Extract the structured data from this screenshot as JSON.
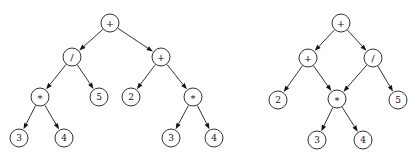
{
  "figure": {
    "background_color": "#ffffff",
    "stroke_color": "#1b1b1b",
    "node_fill_color": "#ffffff",
    "text_color": "#111111",
    "node_radius": 9,
    "arrow_style": "filled-triangle"
  },
  "graphs": [
    {
      "id": "left-tree",
      "name": "expression-tree",
      "kind": "tree",
      "nodes": [
        {
          "id": "L0",
          "label": "+",
          "kind": "operator",
          "x": 110,
          "y": 23
        },
        {
          "id": "L1",
          "label": "/",
          "kind": "operator",
          "x": 72,
          "y": 57
        },
        {
          "id": "L2",
          "label": "+",
          "kind": "operator",
          "x": 161,
          "y": 57
        },
        {
          "id": "L3",
          "label": "*",
          "kind": "operator",
          "x": 40,
          "y": 97
        },
        {
          "id": "L4",
          "label": "5",
          "kind": "leaf",
          "x": 99,
          "y": 97
        },
        {
          "id": "L5",
          "label": "2",
          "kind": "leaf",
          "x": 131,
          "y": 97
        },
        {
          "id": "L6",
          "label": "*",
          "kind": "operator",
          "x": 193,
          "y": 97
        },
        {
          "id": "L7",
          "label": "3",
          "kind": "leaf",
          "x": 19,
          "y": 138
        },
        {
          "id": "L8",
          "label": "4",
          "kind": "leaf",
          "x": 64,
          "y": 138
        },
        {
          "id": "L9",
          "label": "3",
          "kind": "leaf",
          "x": 171,
          "y": 138
        },
        {
          "id": "L10",
          "label": "4",
          "kind": "leaf",
          "x": 214,
          "y": 138
        }
      ],
      "edges": [
        {
          "from": "L0",
          "to": "L1"
        },
        {
          "from": "L0",
          "to": "L2"
        },
        {
          "from": "L1",
          "to": "L3"
        },
        {
          "from": "L1",
          "to": "L4"
        },
        {
          "from": "L2",
          "to": "L5"
        },
        {
          "from": "L2",
          "to": "L6"
        },
        {
          "from": "L3",
          "to": "L7"
        },
        {
          "from": "L3",
          "to": "L8"
        },
        {
          "from": "L6",
          "to": "L9"
        },
        {
          "from": "L6",
          "to": "L10"
        }
      ]
    },
    {
      "id": "right-dag",
      "name": "expression-dag",
      "kind": "dag",
      "nodes": [
        {
          "id": "R0",
          "label": "+",
          "kind": "operator",
          "x": 341,
          "y": 23
        },
        {
          "id": "R1",
          "label": "+",
          "kind": "operator",
          "x": 308,
          "y": 58
        },
        {
          "id": "R2",
          "label": "/",
          "kind": "operator",
          "x": 373,
          "y": 58
        },
        {
          "id": "R3",
          "label": "2",
          "kind": "leaf",
          "x": 278,
          "y": 100
        },
        {
          "id": "R4",
          "label": "*",
          "kind": "operator",
          "x": 337,
          "y": 99
        },
        {
          "id": "R5",
          "label": "5",
          "kind": "leaf",
          "x": 398,
          "y": 100
        },
        {
          "id": "R6",
          "label": "3",
          "kind": "leaf",
          "x": 317,
          "y": 140
        },
        {
          "id": "R7",
          "label": "4",
          "kind": "leaf",
          "x": 363,
          "y": 140
        }
      ],
      "edges": [
        {
          "from": "R0",
          "to": "R1"
        },
        {
          "from": "R0",
          "to": "R2"
        },
        {
          "from": "R1",
          "to": "R3"
        },
        {
          "from": "R1",
          "to": "R4"
        },
        {
          "from": "R2",
          "to": "R4"
        },
        {
          "from": "R2",
          "to": "R5"
        },
        {
          "from": "R4",
          "to": "R6"
        },
        {
          "from": "R4",
          "to": "R7"
        }
      ]
    }
  ]
}
